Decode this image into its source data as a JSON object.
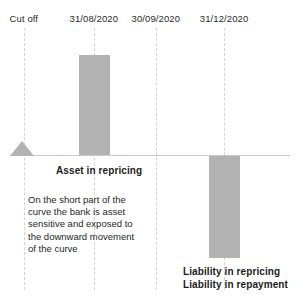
{
  "chart_data": {
    "type": "bar",
    "title": "",
    "xlabel": "",
    "ylabel": "",
    "grid": true,
    "legend": "none",
    "orientation": "vertical",
    "baseline_value": 0,
    "categories": [
      "Cut off",
      "31/08/2020",
      "30/09/2020",
      "31/12/2020"
    ],
    "values": [
      0,
      100,
      0,
      -102
    ],
    "series": [
      {
        "name": "Repricing gap",
        "values": [
          0,
          100,
          0,
          -102
        ]
      }
    ],
    "annotations": [
      {
        "name": "cut-off-marker",
        "shape": "triangle",
        "category": "Cut off",
        "value": 0
      },
      {
        "name": "asset-in-repricing",
        "text": "Asset in repricing"
      },
      {
        "name": "liability-in-repricing",
        "text": "Liability in repricing"
      },
      {
        "name": "liability-in-repayment",
        "text": "Liability in repayment"
      },
      {
        "name": "commentary",
        "text": "On the short part of the curve the bank is asset sensitive and exposed to the downward movement of the curve"
      }
    ],
    "colors": {
      "bar": "#b2b2b2",
      "marker": "#b2b2b2",
      "gridline": "#d2d2d2",
      "baseline": "#c9c9c9",
      "text": "#1c1c1c"
    }
  },
  "axis": {
    "labels": [
      {
        "text": "Cut off",
        "x_pct": 8.0
      },
      {
        "text": "31/08/2020",
        "x_pct": 31.5
      },
      {
        "text": "30/09/2020",
        "x_pct": 52.3
      },
      {
        "text": "31/12/2020",
        "x_pct": 75.2
      }
    ]
  },
  "gridlines": [
    {
      "x_pct": 8.0
    },
    {
      "x_pct": 31.5
    },
    {
      "x_pct": 52.3
    },
    {
      "x_pct": 75.2
    }
  ],
  "labels": {
    "asset_in_repricing": "Asset in repricing",
    "liability_in_repricing": "Liability in repricing",
    "liability_in_repayment": "Liability in repayment"
  },
  "commentary": {
    "line1": "On the short part of the",
    "line2": "curve the bank is asset",
    "line3": "sensitive and exposed to",
    "line4": "the downward movement",
    "line5": "of the curve"
  }
}
